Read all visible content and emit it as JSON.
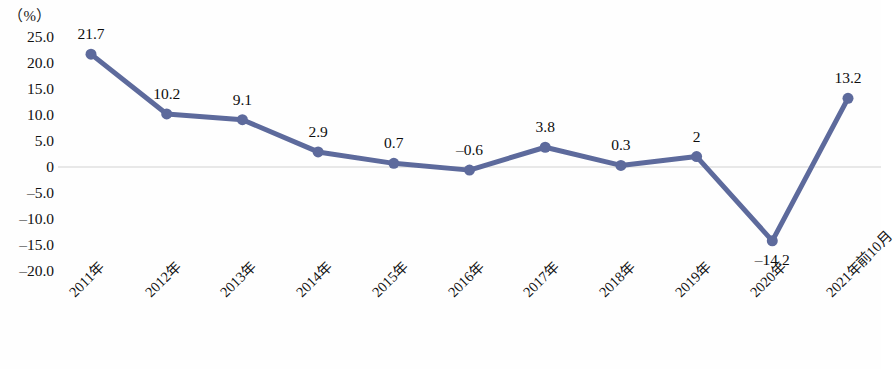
{
  "chart_data": {
    "type": "line",
    "title": "",
    "subtitle": "",
    "xlabel": "",
    "ylabel": "（%）",
    "unit_label": "（%）",
    "categories": [
      "2011年",
      "2012年",
      "2013年",
      "2014年",
      "2015年",
      "2016年",
      "2017年",
      "2018年",
      "2019年",
      "2020年",
      "2021年前10月"
    ],
    "values": [
      21.7,
      10.2,
      9.1,
      2.9,
      0.7,
      -0.6,
      3.8,
      0.3,
      2,
      -14.2,
      13.2
    ],
    "point_labels": [
      "21.7",
      "10.2",
      "9.1",
      "2.9",
      "0.7",
      "–0.6",
      "3.8",
      "0.3",
      "2",
      "–14.2",
      "13.2"
    ],
    "label_positions": [
      "above",
      "above",
      "above",
      "above",
      "above",
      "above",
      "above",
      "above",
      "above",
      "below",
      "above"
    ],
    "ylim": [
      -20,
      25
    ],
    "yticks": [
      25,
      20,
      15,
      10,
      5,
      0,
      -5,
      -10,
      -15,
      -20
    ],
    "ytick_labels": [
      "25.0",
      "20.0",
      "15.0",
      "10.0",
      "5.0",
      "0",
      "–5.0",
      "–10.0",
      "–15.0",
      "–20.0"
    ],
    "grid": false,
    "zero_line": true,
    "legend": null,
    "series_color": "#5d6a9c",
    "zero_line_color": "#e8e8e8",
    "marker": "circle",
    "marker_size": 9,
    "line_width": 5
  }
}
